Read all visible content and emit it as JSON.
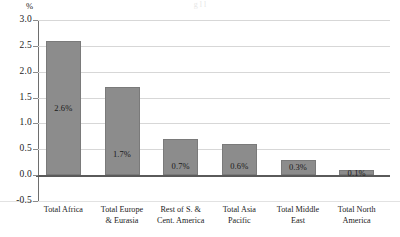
{
  "title_strip": {
    "text": "g                              l l"
  },
  "chart_data": {
    "type": "bar",
    "title": "",
    "subtitle": "",
    "xlabel": "",
    "ylabel": "%",
    "ylim": [
      -0.5,
      3.0
    ],
    "ytick_step": 0.5,
    "yticks": [
      "3.0",
      "2.5",
      "2.0",
      "1.5",
      "1.0",
      "0.5",
      "0.0",
      "-0.5"
    ],
    "ytick_values": [
      3.0,
      2.5,
      2.0,
      1.5,
      1.0,
      0.5,
      0.0,
      -0.5
    ],
    "grid": true,
    "legend": "none",
    "categories": [
      "Total Africa",
      "Total Europe\n& Eurasia",
      "Rest of S. &\nCent. America",
      "Total Asia\nPacific",
      "Total Middle\nEast",
      "Total North\nAmerica"
    ],
    "values": [
      2.6,
      1.7,
      0.7,
      0.6,
      0.3,
      0.1
    ],
    "data_labels": [
      "2.6%",
      "1.7%",
      "0.7%",
      "0.6%",
      "0.3%",
      "0.1%"
    ],
    "bar_color": "#8c8c8c",
    "grid_color": "#d7d7d7",
    "axis_color": "#5a5a5a"
  }
}
